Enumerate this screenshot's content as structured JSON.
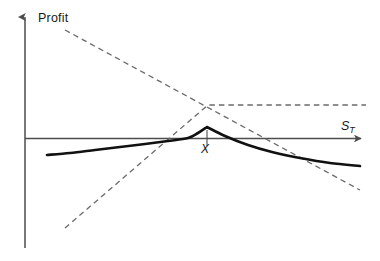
{
  "figure": {
    "title": "",
    "background_color": "#ffffff",
    "width": 380,
    "height": 261
  },
  "labels": {
    "y_axis": "Profit",
    "x_axis_symbol": "S",
    "x_axis_subscript": "T",
    "strike_marker": "X"
  },
  "colors": {
    "axis": "#4d4d4d",
    "solid_curve": "#111111",
    "dashed_curve": "#6b6b6b",
    "text": "#1a1a1a"
  },
  "chart_data": {
    "type": "line",
    "title": "",
    "subtitle": "",
    "xlabel": "S_T",
    "ylabel": "Profit",
    "xlim": [
      0,
      380
    ],
    "ylim": [
      0,
      261
    ],
    "grid": false,
    "legend": null,
    "legend_position": "none",
    "axes": {
      "y_axis_x_px": 25,
      "y_axis_top_px": 12,
      "y_axis_bottom_px": 248,
      "y_axis_arrow": "up",
      "x_axis_y_px": 138,
      "x_axis_left_px": 25,
      "x_axis_right_px": 366,
      "x_axis_arrow": "right",
      "zero_profit_level_px": 138
    },
    "annotations": [
      {
        "text": "X",
        "meaning": "strike-price",
        "x_px": 207,
        "label_x_px": 201,
        "label_y_px": 142,
        "tick_top_px": 130,
        "tick_bottom_px": 146
      }
    ],
    "series": [
      {
        "name": "portfolio-profit",
        "style": "solid",
        "width_px": 2.6,
        "color": "#111111",
        "description": "Covered-call style profit: gently rising concave curve crossing zero near S_T=188px, peaking at the strike X, then falling and flattening to the lower right.",
        "points_px": [
          [
            47,
            155
          ],
          [
            70,
            153
          ],
          [
            95,
            150
          ],
          [
            120,
            147
          ],
          [
            145,
            144
          ],
          [
            168,
            141
          ],
          [
            188,
            138
          ],
          [
            198,
            133
          ],
          [
            207,
            127
          ],
          [
            225,
            136
          ],
          [
            248,
            145
          ],
          [
            272,
            152
          ],
          [
            300,
            158
          ],
          [
            330,
            163
          ],
          [
            360,
            166
          ]
        ]
      },
      {
        "name": "short-position-payoff",
        "style": "dashed",
        "width_px": 1.3,
        "color": "#6b6b6b",
        "description": "Straight descending dashed line from upper left through the zero crossing, continuing down to the lower right.",
        "points_px": [
          [
            65,
            30
          ],
          [
            360,
            190
          ]
        ]
      },
      {
        "name": "long-call-payoff",
        "style": "dashed",
        "width_px": 1.3,
        "color": "#6b6b6b",
        "description": "Ascending dashed line from the lower left that kinks at the strike X and becomes a flat horizontal dashed line to the right edge.",
        "points_px": [
          [
            65,
            228
          ],
          [
            208,
            105
          ],
          [
            366,
            105
          ]
        ]
      }
    ]
  }
}
